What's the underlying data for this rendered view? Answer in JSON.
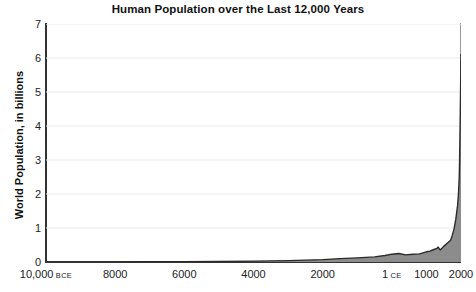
{
  "chart_data": {
    "type": "area",
    "title": "Human Population over the Last 12,000 Years",
    "xlabel": "",
    "ylabel": "World Population, in billions",
    "ylim": [
      0,
      7
    ],
    "xlim": [
      -10000,
      2000
    ],
    "grid": true,
    "legend": "none",
    "fill_color": "#8c8c8c",
    "line_color": "#2b2b2b",
    "grid_color": "#e9e9e9",
    "axis_color": "#333333",
    "yticks": [
      {
        "value": 0,
        "label": "0"
      },
      {
        "value": 1,
        "label": "1"
      },
      {
        "value": 2,
        "label": "2"
      },
      {
        "value": 3,
        "label": "3"
      },
      {
        "value": 4,
        "label": "4"
      },
      {
        "value": 5,
        "label": "5"
      },
      {
        "value": 6,
        "label": "6"
      },
      {
        "value": 7,
        "label": "7"
      }
    ],
    "xticks": [
      {
        "value": -10000,
        "label": "10,000",
        "era": "BCE"
      },
      {
        "value": -8000,
        "label": "8000",
        "era": ""
      },
      {
        "value": -6000,
        "label": "6000",
        "era": ""
      },
      {
        "value": -4000,
        "label": "4000",
        "era": ""
      },
      {
        "value": -2000,
        "label": "2000",
        "era": ""
      },
      {
        "value": 1,
        "label": "1",
        "era": "CE"
      },
      {
        "value": 1000,
        "label": "1000",
        "era": ""
      },
      {
        "value": 2000,
        "label": "2000",
        "era": ""
      }
    ],
    "x": [
      -10000,
      -9000,
      -8000,
      -7000,
      -6000,
      -5000,
      -4000,
      -3000,
      -2000,
      -1500,
      -1000,
      -500,
      -200,
      1,
      200,
      400,
      600,
      800,
      1000,
      1100,
      1200,
      1300,
      1340,
      1400,
      1500,
      1600,
      1700,
      1750,
      1800,
      1850,
      1900,
      1927,
      1950,
      1960,
      1975,
      1987,
      2000
    ],
    "values": [
      0.004,
      0.005,
      0.005,
      0.007,
      0.01,
      0.015,
      0.025,
      0.04,
      0.07,
      0.1,
      0.12,
      0.15,
      0.19,
      0.23,
      0.25,
      0.21,
      0.23,
      0.24,
      0.3,
      0.32,
      0.36,
      0.4,
      0.44,
      0.35,
      0.46,
      0.55,
      0.64,
      0.79,
      0.98,
      1.26,
      1.65,
      2.0,
      2.52,
      3.02,
      4.07,
      5.0,
      6.12
    ]
  }
}
